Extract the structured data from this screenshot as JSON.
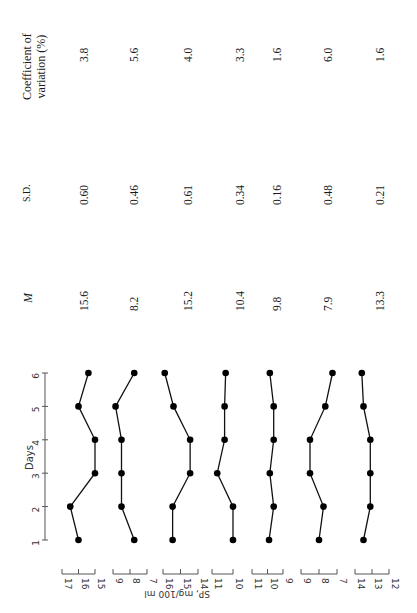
{
  "table": {
    "headers": {
      "cv": "Coefficient of variation (%)",
      "cv_line1": "Coefficient of",
      "cv_line2": "variation (%)",
      "sd": "S.D.",
      "mean": "M"
    },
    "rows": [
      {
        "mean": "15.6",
        "sd": "0.60",
        "cv": "3.8"
      },
      {
        "mean": "8.2",
        "sd": "0.46",
        "cv": "5.6"
      },
      {
        "mean": "15.2",
        "sd": "0.61",
        "cv": "4.0"
      },
      {
        "mean": "10.4",
        "sd": "0.34",
        "cv": "3.3"
      },
      {
        "mean": "9.8",
        "sd": "0.16",
        "cv": "1.6"
      },
      {
        "mean": "7.9",
        "sd": "0.48",
        "cv": "6.0"
      },
      {
        "mean": "13.3",
        "sd": "0.21",
        "cv": "1.6"
      }
    ]
  },
  "axes": {
    "days_label": "Days",
    "days_ticks": [
      "1",
      "2",
      "3",
      "4",
      "5",
      "6"
    ],
    "value_label": "SP, mg/100 ml",
    "scales": [
      [
        "17",
        "16",
        "15"
      ],
      [
        "9",
        "8",
        "7"
      ],
      [
        "16",
        "15",
        "14"
      ],
      [
        "11",
        "10"
      ],
      [
        "11",
        "10",
        "9"
      ],
      [
        "9",
        "8",
        "7"
      ],
      [
        "14",
        "13",
        "12"
      ]
    ]
  },
  "chart_data": {
    "type": "line",
    "title": "",
    "xlabel": "Days",
    "ylabel": "SP, mg/100 ml",
    "x": [
      1,
      2,
      3,
      4,
      5,
      6
    ],
    "orientation": "rotated 90° counter-clockwise (days run bottom-to-top)",
    "grid": false,
    "series": [
      {
        "name": "Subject 1",
        "values": [
          16.0,
          16.5,
          15.0,
          15.0,
          16.0,
          15.4
        ],
        "mean": 15.6,
        "sd": 0.6,
        "cv": 3.8,
        "ylim": [
          15,
          17
        ]
      },
      {
        "name": "Subject 2",
        "values": [
          7.75,
          8.5,
          8.5,
          8.5,
          8.85,
          7.75
        ],
        "mean": 8.2,
        "sd": 0.46,
        "cv": 5.6,
        "ylim": [
          7,
          9
        ]
      },
      {
        "name": "Subject 3",
        "values": [
          15.45,
          15.45,
          14.45,
          14.45,
          15.4,
          15.9
        ],
        "mean": 15.2,
        "sd": 0.61,
        "cv": 4.0,
        "ylim": [
          14,
          16
        ]
      },
      {
        "name": "Subject 4",
        "values": [
          10.0,
          10.0,
          10.75,
          10.4,
          10.4,
          10.35
        ],
        "mean": 10.4,
        "sd": 0.34,
        "cv": 3.3,
        "ylim": [
          10,
          11
        ]
      },
      {
        "name": "Subject 5",
        "values": [
          9.9,
          9.6,
          9.85,
          9.6,
          9.6,
          9.85
        ],
        "mean": 9.8,
        "sd": 0.16,
        "cv": 1.6,
        "ylim": [
          9,
          11
        ]
      },
      {
        "name": "Subject 6",
        "values": [
          8.0,
          7.75,
          8.5,
          8.5,
          7.65,
          7.25
        ],
        "mean": 7.9,
        "sd": 0.48,
        "cv": 6.0,
        "ylim": [
          7,
          9
        ]
      },
      {
        "name": "Subject 7",
        "values": [
          13.5,
          13.1,
          13.1,
          13.1,
          13.5,
          13.6
        ],
        "mean": 13.3,
        "sd": 0.21,
        "cv": 1.6,
        "ylim": [
          12,
          14
        ]
      }
    ]
  }
}
